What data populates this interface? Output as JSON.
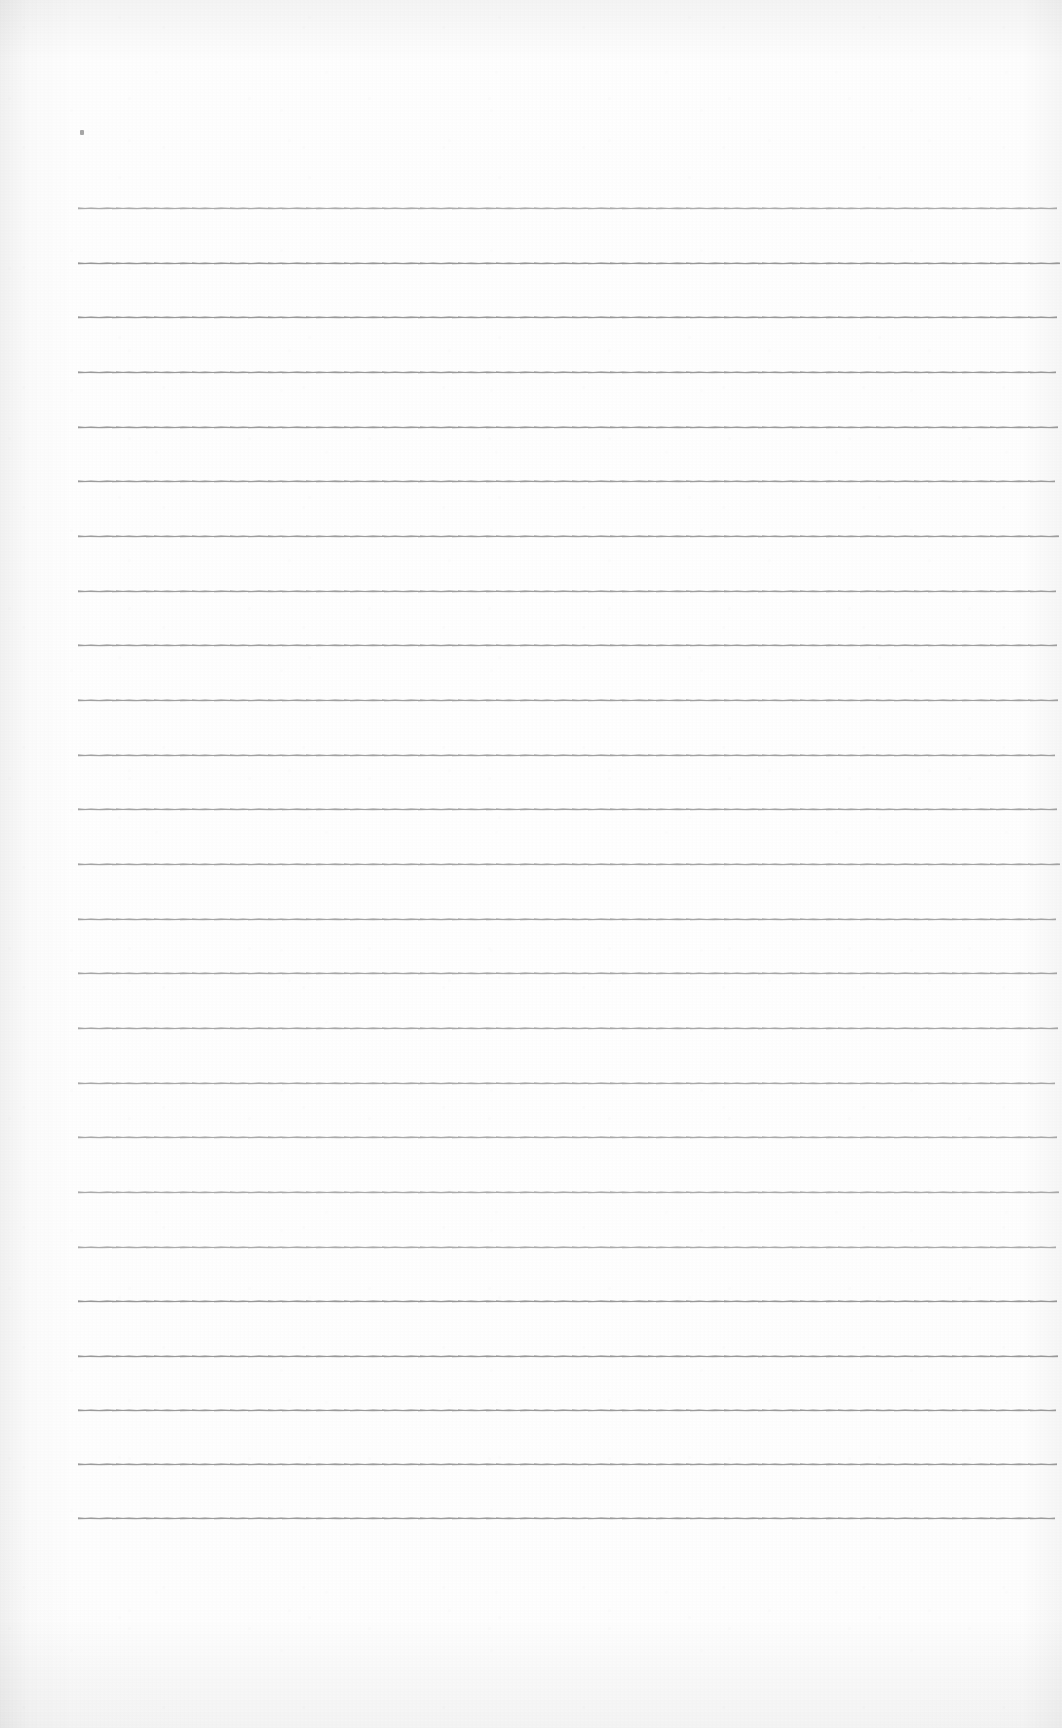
{
  "document": {
    "kind": "scanned-blank-lined-notepad-page",
    "page_width": 1062,
    "page_height": 1728,
    "paper_color": "#fdfdfd",
    "rule_color": "#8d8d8d",
    "body_text": "",
    "heading_text": "",
    "page_number_text": ""
  },
  "ruling": {
    "line_count": 25,
    "first_line_y": 208,
    "line_spacing": 54.6,
    "line_left_x": 78,
    "line_right_x": 1057,
    "line_thickness": 1,
    "lines": [
      {
        "y": 208,
        "left": 78,
        "right": 1057
      },
      {
        "y": 263,
        "left": 78,
        "right": 1060
      },
      {
        "y": 317,
        "left": 78,
        "right": 1057
      },
      {
        "y": 372,
        "left": 78,
        "right": 1056
      },
      {
        "y": 427,
        "left": 78,
        "right": 1058
      },
      {
        "y": 481,
        "left": 78,
        "right": 1055
      },
      {
        "y": 536,
        "left": 78,
        "right": 1059
      },
      {
        "y": 591,
        "left": 78,
        "right": 1056
      },
      {
        "y": 645,
        "left": 78,
        "right": 1057
      },
      {
        "y": 700,
        "left": 78,
        "right": 1058
      },
      {
        "y": 755,
        "left": 78,
        "right": 1055
      },
      {
        "y": 809,
        "left": 78,
        "right": 1057
      },
      {
        "y": 864,
        "left": 78,
        "right": 1060
      },
      {
        "y": 919,
        "left": 78,
        "right": 1056
      },
      {
        "y": 973,
        "left": 78,
        "right": 1057
      },
      {
        "y": 1028,
        "left": 78,
        "right": 1058
      },
      {
        "y": 1083,
        "left": 78,
        "right": 1055
      },
      {
        "y": 1137,
        "left": 78,
        "right": 1057
      },
      {
        "y": 1192,
        "left": 78,
        "right": 1059
      },
      {
        "y": 1247,
        "left": 78,
        "right": 1056
      },
      {
        "y": 1301,
        "left": 78,
        "right": 1057
      },
      {
        "y": 1356,
        "left": 78,
        "right": 1058
      },
      {
        "y": 1410,
        "left": 78,
        "right": 1056
      },
      {
        "y": 1464,
        "left": 78,
        "right": 1057
      },
      {
        "y": 1518,
        "left": 78,
        "right": 1055
      }
    ]
  },
  "marks": {
    "stray_speck": {
      "x": 80,
      "y": 130,
      "label": "faint-ink-speck"
    }
  }
}
